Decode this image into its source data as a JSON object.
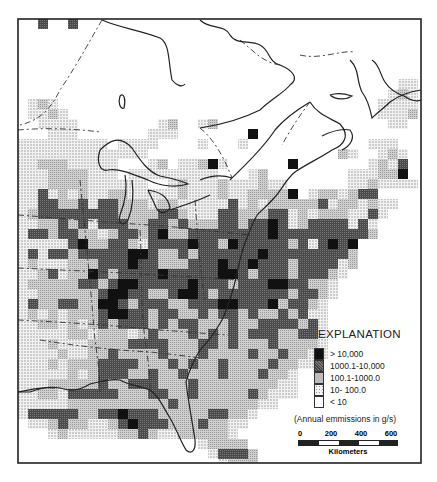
{
  "figure": {
    "type": "gridded emissions map",
    "region": "Eastern United States and southeastern Canada"
  },
  "legend": {
    "title": "EXPLANATION",
    "items": [
      {
        "label": "> 10,000",
        "fill": "#111111",
        "code": 4
      },
      {
        "label": "1000.1-10,000",
        "fill": "#555555",
        "code": 3
      },
      {
        "label": "100.1-1000.0",
        "fill": "#bdbdbd",
        "code": 2
      },
      {
        "label": "10- 100.0",
        "fill": "#e2e2e2",
        "code": 1
      },
      {
        "label": "< 10",
        "fill": "#ffffff",
        "code": 0
      }
    ],
    "note": "(Annual emmissions in g/s)"
  },
  "scale": {
    "ticks": [
      "0",
      "200",
      "400",
      "600"
    ],
    "unit": "Kilometers"
  },
  "grid": {
    "origin_x": 18,
    "origin_y": 19,
    "cell": 10,
    "rows": [
      "0030030000000000000000000000000000000000",
      "0000000000000000000000000000000000000000",
      "0000000000000000000000000000000000000000",
      "0000000000000000000000000000000000000000",
      "0000000000000000000000000000000000000000",
      "0000000000000000000000000000000000000000",
      "0000000000000000000000000000000000000011",
      "0000000000000000000000000000000000000121",
      "0121000000000000000000000000000000001111",
      "0112100000000000000000000000000000001112",
      "0011110000000012001200000000000000000110",
      "0001110000000111000000040000000000000000",
      "1111111110111100001000100000000000011100",
      "1111111111111000000000000000000021001210",
      "1122211111000120112410000004000000012130",
      "1112222111011111111100012000000001112240",
      "1112222111111001211121112110000001121111",
      "1131212112211111211121122224012212330000",
      "1133223133222122111113121222223122121100",
      "1233333333222233211133222331212221131000",
      "1122323133322332322233233431233331310000",
      "1332332212332342233333333433333333320000",
      "1111134223321333343324333332313434000000",
      "1313323333344322323333334333333332000000",
      "1211122233343322233343343332333312000000",
      "1123122432333343333344323332333210000000",
      "1222223323443333343332333443322100000000",
      "1122222234433223443233333332332100000000",
      "1322332244323332233344333423321000000000",
      "1212122234433233223233232232311000000000",
      "1122121232333232332223223333231000000000",
      "1111122122212322232323233322331000000000",
      "1112111222233332223323222322221000000000",
      "1111211223222232223222232232211000000000",
      "1112122233332223232232222322110000000000",
      "1111121233322322322232223221000000000000",
      "1112222232233322232222222211000000000000",
      "1122133333222332232222232111000000000000",
      "1111122222222223222222221100000000000000",
      "1333332233433322222332210000000000000000",
      "0112322112343332223221100000000000000000",
      "0001211111223211222221000000000000000000",
      "0000000000000000001222200000000000000000",
      "0000000000000000000133320000000000000000",
      "0000000000000000000012220000000000000000"
    ]
  }
}
